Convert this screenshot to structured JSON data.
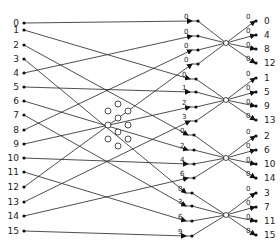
{
  "diagram": {
    "type": "fft-butterfly-network",
    "inputs": [
      "0",
      "1",
      "2",
      "3",
      "4",
      "5",
      "6",
      "7",
      "8",
      "9",
      "10",
      "11",
      "12",
      "13",
      "14",
      "15"
    ],
    "outputs": [
      "0",
      "4",
      "8",
      "12",
      "1",
      "5",
      "9",
      "13",
      "2",
      "6",
      "10",
      "14",
      "3",
      "7",
      "11",
      "15"
    ],
    "stage1_weights": [
      [
        "0",
        "0",
        "0",
        "0"
      ],
      [
        "0",
        "1",
        "2",
        "3"
      ],
      [
        "0",
        "2",
        "4",
        "6"
      ],
      [
        "0",
        "3",
        "6",
        "9"
      ]
    ],
    "stage2_weights": [
      "0",
      "0",
      "0",
      "0"
    ],
    "colors": {
      "line": "#222222",
      "background": "#ffffff"
    }
  }
}
